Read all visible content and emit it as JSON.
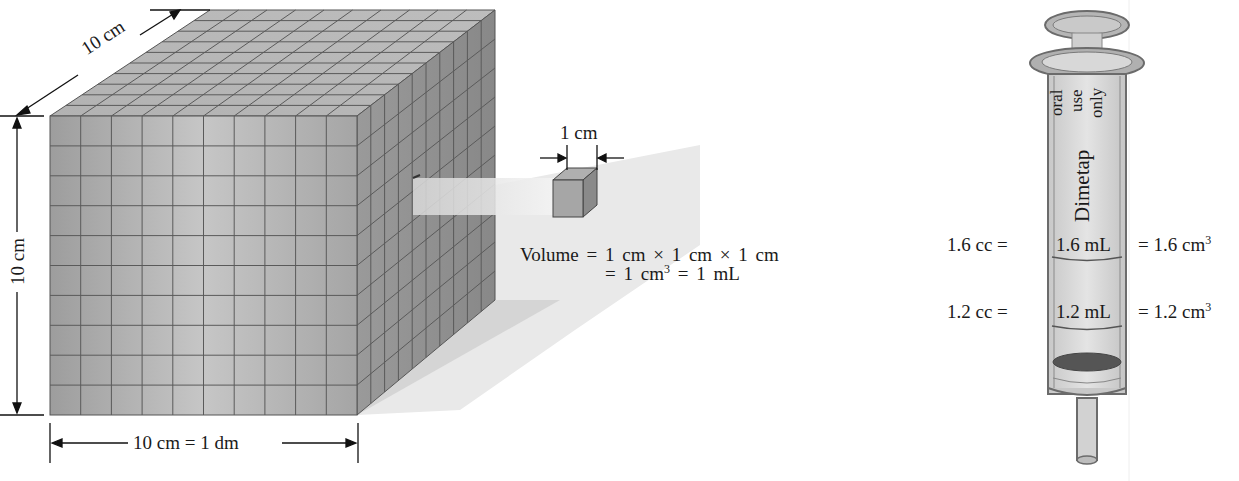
{
  "cube": {
    "depth_label": "10 cm",
    "height_label": "10 cm",
    "width_label": "10 cm = 1 dm",
    "grid_divisions": 10
  },
  "small_cube": {
    "edge_label": "1 cm",
    "volume_line1": "Volume = 1 cm × 1 cm × 1 cm",
    "volume_line2_prefix": "= 1 cm",
    "volume_line2_sup": "3",
    "volume_line2_suffix": " = 1 mL"
  },
  "syringe": {
    "label_line1": "oral",
    "label_line2": "use",
    "label_line3": "only",
    "brand": "Dimetap",
    "marks": [
      {
        "cc": "1.6 cc =",
        "ml": "1.6 mL",
        "cm3_prefix": "= 1.6 cm",
        "cm3_sup": "3"
      },
      {
        "cc": "1.2 cc =",
        "ml": "1.2 mL",
        "cm3_prefix": "= 1.2 cm",
        "cm3_sup": "3"
      }
    ]
  },
  "colors": {
    "cube_front": "#a9a9a9",
    "cube_top": "#b9b9b9",
    "cube_side": "#8f8f8f",
    "grid_line": "#555555",
    "syringe_body": "#d4d4d4",
    "syringe_outline": "#6b6b6b",
    "plunger": "#5a5a5a",
    "text": "#1a1a1a"
  }
}
